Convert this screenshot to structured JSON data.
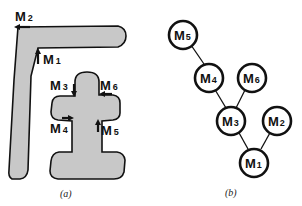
{
  "panel_a": {
    "caption": "(a)",
    "shape_fill": "#c8c8c8",
    "outline": "#111111",
    "markers": [
      {
        "id": "M2",
        "label": "M",
        "sub": "2"
      },
      {
        "id": "M1",
        "label": "M",
        "sub": "1"
      },
      {
        "id": "M3",
        "label": "M",
        "sub": "3"
      },
      {
        "id": "M6",
        "label": "M",
        "sub": "6"
      },
      {
        "id": "M4",
        "label": "M",
        "sub": "4"
      },
      {
        "id": "M5",
        "label": "M",
        "sub": "5"
      }
    ]
  },
  "panel_b": {
    "caption": "(b)",
    "nodes": [
      {
        "id": "M5",
        "label": "M",
        "sub": "5"
      },
      {
        "id": "M4",
        "label": "M",
        "sub": "4"
      },
      {
        "id": "M6",
        "label": "M",
        "sub": "6"
      },
      {
        "id": "M3",
        "label": "M",
        "sub": "3"
      },
      {
        "id": "M2",
        "label": "M",
        "sub": "2"
      },
      {
        "id": "M1",
        "label": "M",
        "sub": "1"
      }
    ],
    "edges": [
      [
        "M5",
        "M4"
      ],
      [
        "M4",
        "M3"
      ],
      [
        "M6",
        "M3"
      ],
      [
        "M3",
        "M1"
      ],
      [
        "M2",
        "M1"
      ]
    ]
  }
}
